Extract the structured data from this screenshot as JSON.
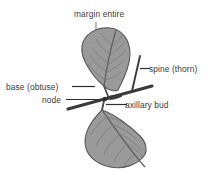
{
  "diagram": {
    "background_color": "#ffffff",
    "labels": {
      "margin_entire": "margin entire",
      "base_obtuse": "base (obtuse)",
      "node": "node",
      "spine_thorn": "spine (thorn)",
      "axillary_bud": "axillary bud"
    },
    "colors": {
      "leaf_fill": "#9a9a9a",
      "leaf_outline": "#5a5a5a",
      "vein": "#6b6b6b",
      "midrib": "#4a4a4a",
      "stem": "#3a3a3a",
      "spine": "#3a3a3a",
      "leader_line": "#2e2e2e",
      "callout_line_light": "#9d9d9d",
      "text": "#3b3b3b"
    },
    "parts": {
      "upper_leaf": "upper-leaf",
      "lower_leaf": "lower-leaf",
      "stem": "stem",
      "spine": "spine",
      "node_point": "node-point",
      "axillary_bud": "axillary-bud"
    }
  }
}
